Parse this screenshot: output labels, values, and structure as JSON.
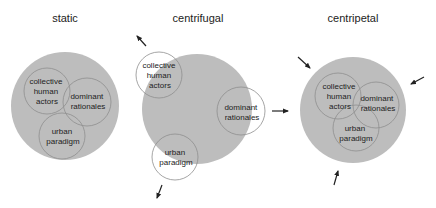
{
  "panels": [
    {
      "title": "static",
      "circles": {
        "collective": [
          "collective",
          "human",
          "actors"
        ],
        "dominant": [
          "dominant",
          "rationales"
        ],
        "urban": [
          "urban",
          "paradigm"
        ]
      }
    },
    {
      "title": "centrifugal",
      "circles": {
        "collective": [
          "collective",
          "human",
          "actors"
        ],
        "dominant": [
          "dominant",
          "rationales"
        ],
        "urban": [
          "urban",
          "paradigm"
        ]
      }
    },
    {
      "title": "centripetal",
      "circles": {
        "collective": [
          "collective",
          "human",
          "actors"
        ],
        "dominant": [
          "dominant",
          "rationales"
        ],
        "urban": [
          "urban",
          "paradigm"
        ]
      }
    }
  ],
  "colors": {
    "big_circle": "#bdbdbd",
    "outline": "#8e8e8e",
    "text": "#222222"
  }
}
